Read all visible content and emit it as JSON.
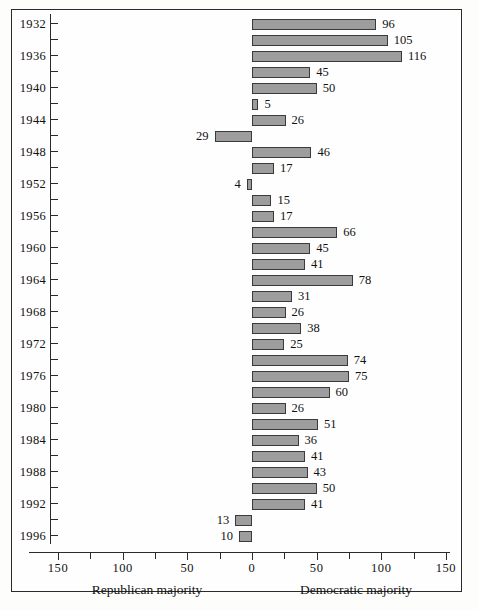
{
  "chart_data": {
    "type": "bar",
    "orientation": "horizontal-diverging",
    "title": "",
    "subtitle": "",
    "xlabel": "",
    "ylabel": "",
    "xlim": [
      -150,
      150
    ],
    "grid": false,
    "legend_position": "none",
    "axis_captions": {
      "left": "Republican majority",
      "right": "Democratic majority"
    },
    "xticks": [
      {
        "label": "150",
        "value": -150
      },
      {
        "label": "100",
        "value": -100
      },
      {
        "label": "50",
        "value": -50
      },
      {
        "label": "0",
        "value": 0
      },
      {
        "label": "50",
        "value": 50
      },
      {
        "label": "100",
        "value": 100
      },
      {
        "label": "150",
        "value": 150
      }
    ],
    "xticks_minor": [
      -125,
      -75,
      -25,
      25,
      75,
      125
    ],
    "categories": [
      "1932",
      "1934",
      "1936",
      "1938",
      "1940",
      "1942",
      "1944",
      "1946",
      "1948",
      "1950",
      "1952",
      "1954",
      "1956",
      "1958",
      "1960",
      "1962",
      "1964",
      "1966",
      "1968",
      "1970",
      "1972",
      "1974",
      "1976",
      "1978",
      "1980",
      "1982",
      "1984",
      "1986",
      "1988",
      "1990",
      "1992",
      "1994",
      "1996"
    ],
    "category_labels_shown": [
      "1932",
      "1936",
      "1940",
      "1944",
      "1948",
      "1952",
      "1956",
      "1960",
      "1964",
      "1968",
      "1972",
      "1976",
      "1980",
      "1984",
      "1988",
      "1992",
      "1996"
    ],
    "values": [
      96,
      105,
      116,
      45,
      50,
      5,
      26,
      -29,
      46,
      17,
      -4,
      15,
      17,
      66,
      45,
      41,
      78,
      31,
      26,
      38,
      25,
      74,
      75,
      60,
      26,
      51,
      36,
      41,
      43,
      50,
      41,
      -13,
      -10
    ],
    "value_labels": [
      "96",
      "105",
      "116",
      "45",
      "50",
      "5",
      "26",
      "29",
      "46",
      "17",
      "4",
      "15",
      "17",
      "66",
      "45",
      "41",
      "78",
      "31",
      "26",
      "38",
      "25",
      "74",
      "75",
      "60",
      "26",
      "51",
      "36",
      "41",
      "43",
      "50",
      "41",
      "13",
      "10"
    ],
    "bar_fill_color": "#9d9d9d",
    "bar_border_color": "#3a3a3a",
    "axis_color": "#2b2b2b"
  }
}
